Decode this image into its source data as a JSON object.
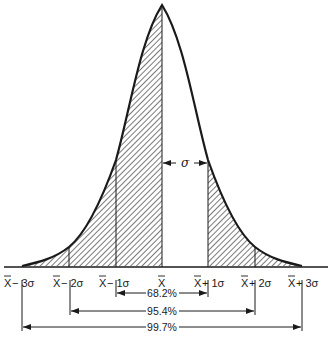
{
  "diagram": {
    "colors": {
      "ink": "#1a1a1a",
      "background": "#ffffff",
      "hatch": "#333333"
    },
    "axis_labels": [
      {
        "id": "m3",
        "mean": "X",
        "suffix": " − 3σ",
        "x": 30
      },
      {
        "id": "m2",
        "mean": "X",
        "suffix": " − 2σ",
        "x": 77
      },
      {
        "id": "m1",
        "mean": "X",
        "suffix": " − 1σ",
        "x": 123
      },
      {
        "id": "m0",
        "mean": "X",
        "suffix": "",
        "x": 162
      },
      {
        "id": "p1",
        "mean": "X",
        "suffix": " + 1σ",
        "x": 213
      },
      {
        "id": "p2",
        "mean": "X",
        "suffix": " + 2σ",
        "x": 259
      },
      {
        "id": "p3",
        "mean": "X",
        "suffix": " + 3σ",
        "x": 306
      }
    ],
    "sigma_marker": "σ",
    "ranges": [
      {
        "label": "68.2%",
        "from": "X − 1σ",
        "to": "X + 1σ"
      },
      {
        "label": "95.4%",
        "from": "X − 2σ",
        "to": "X + 2σ"
      },
      {
        "label": "99.7%",
        "from": "X − 3σ",
        "to": "X + 3σ"
      }
    ],
    "shaded_regions": [
      "left half (below mean)",
      "right tail beyond X + 1σ"
    ],
    "unshaded_region": "mean to X + 1σ"
  }
}
